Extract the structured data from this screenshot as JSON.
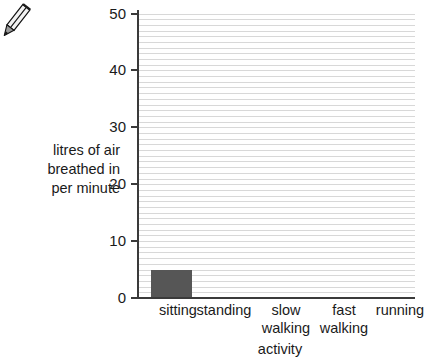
{
  "icons": {
    "pencil": "pencil-icon"
  },
  "chart_data": {
    "type": "bar",
    "title": "",
    "xlabel": "activity",
    "ylabel": "litres of air breathed in per minute",
    "ylabel_lines": [
      "litres of air",
      "breathed in",
      "per minute"
    ],
    "categories": [
      "sitting",
      "standing",
      "slow walking",
      "fast walking",
      "running"
    ],
    "category_lines": [
      [
        "sitting",
        ""
      ],
      [
        "standing",
        ""
      ],
      [
        "slow",
        "walking"
      ],
      [
        "fast",
        "walking"
      ],
      [
        "running",
        ""
      ]
    ],
    "values": [
      5,
      null,
      null,
      null,
      null
    ],
    "ylim": [
      0,
      50
    ],
    "ytick_labels": [
      "50",
      "40",
      "30",
      "20",
      "10",
      "0"
    ],
    "ytick_values": [
      50,
      40,
      30,
      20,
      10,
      0
    ],
    "grid": "horizontal",
    "grid_step": 1,
    "legend": "none",
    "bar_color": "#565656",
    "grid_color": "#d8d8d8",
    "axis_color": "#3a3a3a"
  }
}
